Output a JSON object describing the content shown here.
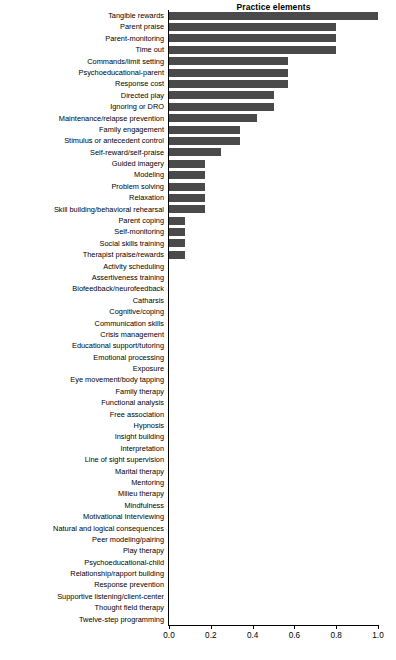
{
  "chart_data": {
    "type": "bar",
    "orientation": "horizontal",
    "title": "Practice elements",
    "xlabel": "",
    "ylabel": "",
    "xlim": [
      0.0,
      1.0
    ],
    "xticks": [
      "0.0",
      "0.2",
      "0.4",
      "0.6",
      "0.8",
      "1.0"
    ],
    "xtick_values": [
      0.0,
      0.2,
      0.4,
      0.6,
      0.8,
      1.0
    ],
    "grid": false,
    "legend": false,
    "bar_color": "#4a4a4a",
    "axis_color": "#000000",
    "background": "#ffffff",
    "categories": [
      "Tangible rewards",
      "Parent praise",
      "Parent-monitoring",
      "Time out",
      "Commands/limit setting",
      "Psychoeducational-parent",
      "Response cost",
      "Directed play",
      "Ignoring or DRO",
      "Maintenance/relapse prevention",
      "Family engagement",
      "Stimulus or antecedent control",
      "Self-reward/self-praise",
      "Guided imagery",
      "Modeling",
      "Problem solving",
      "Relaxation",
      "Skill building/behavioral rehearsal",
      "Parent coping",
      "Self-monitoring",
      "Social skills training",
      "Therapist praise/rewards",
      "Activity scheduling",
      "Assertiveness training",
      "Biofeedback/neurofeedback",
      "Catharsis",
      "Cognitive/coping",
      "Communication skills",
      "Crisis management",
      "Educational support/tutoring",
      "Emotional processing",
      "Exposure",
      "Eye movement/body tapping",
      "Family therapy",
      "Functional analysis",
      "Free association",
      "Hypnosis",
      "Insight building",
      "Interpretation",
      "Line of sight supervision",
      "Marital therapy",
      "Mentoring",
      "Milieu therapy",
      "Mindfulness",
      "Motivational Interviewing",
      "Natural and logical consequences",
      "Peer modeling/pairing",
      "Play therapy",
      "Psychoeducational-child",
      "Relationship/rapport building",
      "Response prevention",
      "Supportive listening/client-center",
      "Thought field therapy",
      "Twelve-step programming"
    ],
    "values": [
      1.0,
      0.8,
      0.8,
      0.8,
      0.57,
      0.57,
      0.57,
      0.5,
      0.5,
      0.42,
      0.34,
      0.34,
      0.25,
      0.17,
      0.17,
      0.17,
      0.17,
      0.17,
      0.075,
      0.075,
      0.075,
      0.075,
      0.0,
      0.0,
      0.0,
      0.0,
      0.0,
      0.0,
      0.0,
      0.0,
      0.0,
      0.0,
      0.0,
      0.0,
      0.0,
      0.0,
      0.0,
      0.0,
      0.0,
      0.0,
      0.0,
      0.0,
      0.0,
      0.0,
      0.0,
      0.0,
      0.0,
      0.0,
      0.0,
      0.0,
      0.0,
      0.0,
      0.0,
      0.0
    ]
  }
}
